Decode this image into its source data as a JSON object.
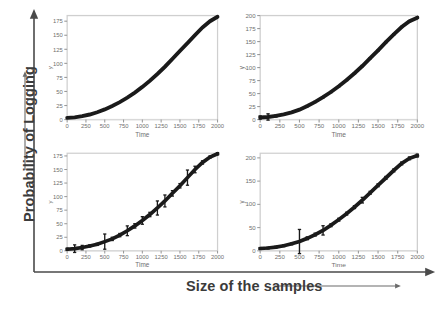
{
  "figure": {
    "outer_axes": {
      "y_label": "Probability of Logging",
      "x_label": "Size of the samples",
      "y_arrow_icon": "up-arrow-icon",
      "x_arrow_icon": "right-arrow-icon",
      "label_color": "#3b3b3b"
    },
    "curve_color": "#1a1a1a",
    "frame_color": "#cfcfcf",
    "tick_color": "#6f6f6f",
    "refline_color": "#d9d9d9"
  },
  "chart_data": [
    {
      "type": "line",
      "panel": "top-left",
      "title": "",
      "xlabel": "Time",
      "ylabel": "y",
      "xlim": [
        0,
        2000
      ],
      "ylim": [
        0,
        185
      ],
      "xticks": [
        0,
        250,
        500,
        750,
        1000,
        1250,
        1500,
        1750,
        2000
      ],
      "yticks": [
        0,
        25,
        50,
        75,
        100,
        125,
        150,
        175
      ],
      "grid": false,
      "legend": "none",
      "reference_line_y": 0,
      "x": [
        0,
        100,
        200,
        300,
        400,
        500,
        600,
        700,
        800,
        900,
        1000,
        1100,
        1200,
        1300,
        1400,
        1500,
        1600,
        1700,
        1800,
        1900,
        2000
      ],
      "y": [
        3,
        4,
        6,
        9,
        13,
        18,
        24,
        31,
        39,
        48,
        58,
        69,
        81,
        94,
        108,
        122,
        136,
        150,
        164,
        175,
        183
      ],
      "error": [
        0,
        0,
        0,
        0,
        0,
        0,
        0,
        0,
        0,
        0,
        0,
        0,
        0,
        0,
        0,
        0,
        0,
        0,
        0,
        0,
        0
      ]
    },
    {
      "type": "line",
      "panel": "top-right",
      "title": "",
      "xlabel": "Time",
      "ylabel": "y",
      "xlim": [
        0,
        2000
      ],
      "ylim": [
        0,
        200
      ],
      "xticks": [
        0,
        250,
        500,
        750,
        1000,
        1250,
        1500,
        1750,
        2000
      ],
      "yticks": [
        0,
        25,
        50,
        75,
        100,
        125,
        150,
        175,
        200
      ],
      "grid": false,
      "legend": "none",
      "reference_line_y": 0,
      "x": [
        0,
        100,
        200,
        300,
        400,
        500,
        600,
        700,
        800,
        900,
        1000,
        1100,
        1200,
        1300,
        1400,
        1500,
        1600,
        1700,
        1800,
        1900,
        2000
      ],
      "y": [
        4,
        5,
        7,
        10,
        14,
        19,
        26,
        34,
        43,
        53,
        64,
        76,
        89,
        103,
        118,
        133,
        149,
        164,
        178,
        189,
        196
      ],
      "error": [
        3,
        6,
        2,
        1,
        1,
        1,
        1,
        1,
        1,
        1,
        1,
        1,
        1,
        1,
        1,
        1,
        1,
        1,
        1,
        1,
        1
      ]
    },
    {
      "type": "line",
      "panel": "bottom-left",
      "title": "",
      "xlabel": "Time",
      "ylabel": "y",
      "xlim": [
        0,
        2000
      ],
      "ylim": [
        0,
        180
      ],
      "xticks": [
        0,
        250,
        500,
        750,
        1000,
        1250,
        1500,
        1750,
        2000
      ],
      "yticks": [
        0,
        25,
        50,
        75,
        100,
        125,
        150,
        175
      ],
      "grid": false,
      "legend": "none",
      "reference_line_y": 0,
      "x": [
        0,
        100,
        200,
        300,
        400,
        500,
        600,
        700,
        800,
        900,
        1000,
        1100,
        1200,
        1300,
        1400,
        1500,
        1600,
        1700,
        1800,
        1900,
        2000
      ],
      "y": [
        3,
        4,
        6,
        9,
        12,
        17,
        22,
        29,
        37,
        46,
        56,
        67,
        79,
        92,
        106,
        120,
        135,
        150,
        163,
        173,
        179
      ],
      "error": [
        2,
        7,
        4,
        2,
        2,
        14,
        3,
        3,
        9,
        4,
        7,
        4,
        13,
        11,
        5,
        4,
        14,
        6,
        3,
        2,
        2
      ]
    },
    {
      "type": "line",
      "panel": "bottom-right",
      "title": "",
      "xlabel": "Time",
      "ylabel": "y",
      "xlim": [
        0,
        2000
      ],
      "ylim": [
        0,
        210
      ],
      "xticks": [
        0,
        250,
        500,
        750,
        1000,
        1250,
        1500,
        1750,
        2000
      ],
      "yticks": [
        0,
        50,
        100,
        150,
        200
      ],
      "grid": false,
      "legend": "none",
      "reference_line_y": 0,
      "x": [
        0,
        100,
        200,
        300,
        400,
        500,
        600,
        700,
        800,
        900,
        1000,
        1100,
        1200,
        1300,
        1400,
        1500,
        1600,
        1700,
        1800,
        1900,
        2000
      ],
      "y": [
        5,
        6,
        8,
        11,
        15,
        20,
        27,
        35,
        44,
        55,
        67,
        80,
        94,
        109,
        125,
        141,
        157,
        173,
        188,
        199,
        205
      ],
      "error": [
        2,
        2,
        2,
        2,
        2,
        26,
        3,
        3,
        10,
        3,
        3,
        3,
        3,
        6,
        3,
        3,
        3,
        3,
        3,
        3,
        3
      ]
    }
  ]
}
